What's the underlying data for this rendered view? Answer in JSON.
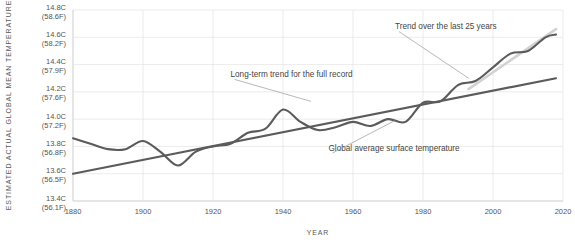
{
  "chart_data": {
    "type": "line",
    "title": "",
    "xlabel": "YEAR",
    "ylabel": "ESTIMATED ACTUAL GLOBAL MEAN TEMPERATURE",
    "xlim": [
      1880,
      2020
    ],
    "ylim": [
      13.4,
      14.8
    ],
    "grid": true,
    "legend_position": "none",
    "x_ticks": [
      1880,
      1900,
      1920,
      1940,
      1960,
      1980,
      2000,
      2020
    ],
    "x_tick_labels": [
      "1880",
      "1900",
      "1920",
      "1940",
      "1960",
      "1980",
      "2000",
      "2020"
    ],
    "y_ticks": [
      13.4,
      13.6,
      13.8,
      14.0,
      14.2,
      14.4,
      14.6,
      14.8
    ],
    "y_tick_labels": [
      "13.4C\n(56.1F)",
      "13.6C\n(56.5F)",
      "13.8C\n(56.8F)",
      "14.0C\n(57.2F)",
      "14.2C\n(57.6F)",
      "14.4C\n(57.9F)",
      "14.6C\n(58.2F)",
      "14.8C\n(58.6F)"
    ],
    "y_tick_labels_celsius": [
      "13.4C",
      "13.6C",
      "13.8C",
      "14.0C",
      "14.2C",
      "14.4C",
      "14.6C",
      "14.8C"
    ],
    "y_tick_labels_fahrenheit": [
      "(56.1F)",
      "(56.5F)",
      "(56.8F)",
      "(57.2F)",
      "(57.6F)",
      "(57.9F)",
      "(58.2F)",
      "(58.6F)"
    ],
    "series": [
      {
        "name": "Global average surface temperature",
        "color": "#5b5b5b",
        "style": "smoothed-line",
        "x": [
          1880,
          1885,
          1890,
          1895,
          1900,
          1905,
          1910,
          1915,
          1920,
          1925,
          1930,
          1935,
          1940,
          1945,
          1950,
          1955,
          1960,
          1965,
          1970,
          1975,
          1980,
          1985,
          1990,
          1995,
          2000,
          2005,
          2010,
          2015,
          2018
        ],
        "values": [
          13.86,
          13.82,
          13.78,
          13.78,
          13.84,
          13.76,
          13.66,
          13.76,
          13.8,
          13.82,
          13.9,
          13.93,
          14.07,
          13.98,
          13.92,
          13.94,
          13.98,
          13.95,
          14.0,
          13.98,
          14.12,
          14.13,
          14.25,
          14.28,
          14.38,
          14.48,
          14.5,
          14.6,
          14.62
        ]
      },
      {
        "name": "Long-term trend for the full record",
        "color": "#5b5b5b",
        "style": "straight-line",
        "x": [
          1880,
          2018
        ],
        "values": [
          13.6,
          14.3
        ]
      },
      {
        "name": "Trend over the last 25 years",
        "color": "#d2d2d2",
        "style": "straight-line",
        "x": [
          1993,
          2018
        ],
        "values": [
          14.22,
          14.66
        ]
      }
    ],
    "annotations": [
      {
        "id": "annotation-long-term-trend",
        "text": "Long-term trend for the full record",
        "text_x": 1925,
        "text_y": 14.31,
        "leader_from": [
          1925,
          14.31
        ],
        "leader_to": [
          1948,
          14.13
        ]
      },
      {
        "id": "annotation-recent-trend",
        "text": "Trend over the last 25 years",
        "text_x": 1972,
        "text_y": 14.66,
        "leader_from": [
          1972,
          14.66
        ],
        "leader_to": [
          1993,
          14.3
        ]
      },
      {
        "id": "annotation-global-average",
        "text": "Global average surface temperature",
        "text_x": 1953,
        "text_y": 13.77,
        "leader_from": [
          1953,
          13.77
        ],
        "leader_to": [
          1972,
          13.99
        ]
      }
    ]
  }
}
